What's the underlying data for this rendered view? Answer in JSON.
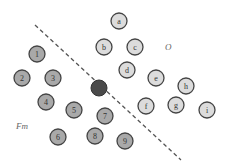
{
  "diagram": {
    "separator": {
      "x1": 35,
      "y1": 25,
      "x2": 181,
      "y2": 160,
      "style": "dashed",
      "color": "#555555"
    },
    "regions": [
      {
        "name": "O",
        "label": "O",
        "x": 165,
        "y": 50
      },
      {
        "name": "Fm",
        "label": "Fm",
        "x": 16,
        "y": 129
      }
    ],
    "colors": {
      "left_fill": "#a9a9a9",
      "right_fill": "#dcdcdc",
      "stroke": "#444444",
      "pivot_fill": "#4a4a4a"
    },
    "pivot": {
      "x": 99,
      "y": 88,
      "r": 8
    },
    "left_nodes": [
      {
        "label": "1",
        "x": 37,
        "y": 54
      },
      {
        "label": "2",
        "x": 22,
        "y": 78
      },
      {
        "label": "3",
        "x": 53,
        "y": 78
      },
      {
        "label": "4",
        "x": 46,
        "y": 102
      },
      {
        "label": "5",
        "x": 74,
        "y": 110
      },
      {
        "label": "6",
        "x": 58,
        "y": 137
      },
      {
        "label": "7",
        "x": 105,
        "y": 116
      },
      {
        "label": "8",
        "x": 95,
        "y": 136
      },
      {
        "label": "9",
        "x": 125,
        "y": 141
      }
    ],
    "right_nodes": [
      {
        "label": "a",
        "x": 119,
        "y": 21
      },
      {
        "label": "b",
        "x": 104,
        "y": 47
      },
      {
        "label": "c",
        "x": 135,
        "y": 47
      },
      {
        "label": "d",
        "x": 127,
        "y": 70
      },
      {
        "label": "e",
        "x": 156,
        "y": 78
      },
      {
        "label": "f",
        "x": 146,
        "y": 106
      },
      {
        "label": "g",
        "x": 176,
        "y": 105
      },
      {
        "label": "h",
        "x": 186,
        "y": 86
      },
      {
        "label": "i",
        "x": 207,
        "y": 110
      }
    ],
    "node_radius": 8
  }
}
